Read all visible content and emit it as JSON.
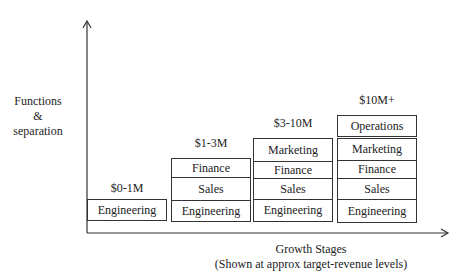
{
  "y_axis": {
    "label_lines": [
      "Functions",
      "&",
      "separation"
    ]
  },
  "x_axis": {
    "title": "Growth Stages",
    "subtitle": "(Shown at approx target-revenue levels)"
  },
  "stages": [
    {
      "revenue": "$0-1M",
      "functions": [
        "Engineering"
      ]
    },
    {
      "revenue": "$1-3M",
      "functions": [
        "Finance",
        "Sales",
        "Engineering"
      ]
    },
    {
      "revenue": "$3-10M",
      "functions": [
        "Marketing",
        "Finance",
        "Sales",
        "Engineering"
      ]
    },
    {
      "revenue": "$10M+",
      "separate_function": "Operations",
      "functions": [
        "Marketing",
        "Finance",
        "Sales",
        "Engineering"
      ]
    }
  ],
  "colors": {
    "line": "#333333",
    "text": "#222222",
    "background": "#ffffff"
  }
}
